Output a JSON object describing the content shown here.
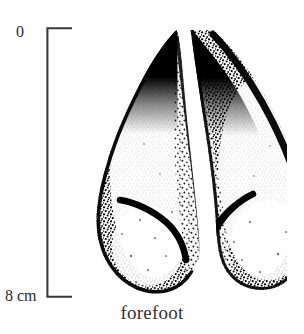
{
  "figure": {
    "background_color": "#ffffff",
    "ink_color": "#000000"
  },
  "scale_bar": {
    "name": "vertical-scale-bar",
    "top_label": "0",
    "bottom_label": "8 cm",
    "unit": "cm",
    "min_value": "0",
    "max_value": "8",
    "orientation": "vertical",
    "bracket_color": "#3a3a3a"
  },
  "caption": {
    "text": "forefoot"
  },
  "illustration": {
    "subject": "forefoot",
    "type": "cloven-hoof-track",
    "description": "Stippled ink drawing of a two-lobed cloven hoof print (forefoot), dark solid tips at top and stippled shading along the inner and outer margins.",
    "lobes": [
      {
        "side": "left",
        "name": "left-hoof-lobe"
      },
      {
        "side": "right",
        "name": "right-hoof-lobe"
      }
    ]
  }
}
